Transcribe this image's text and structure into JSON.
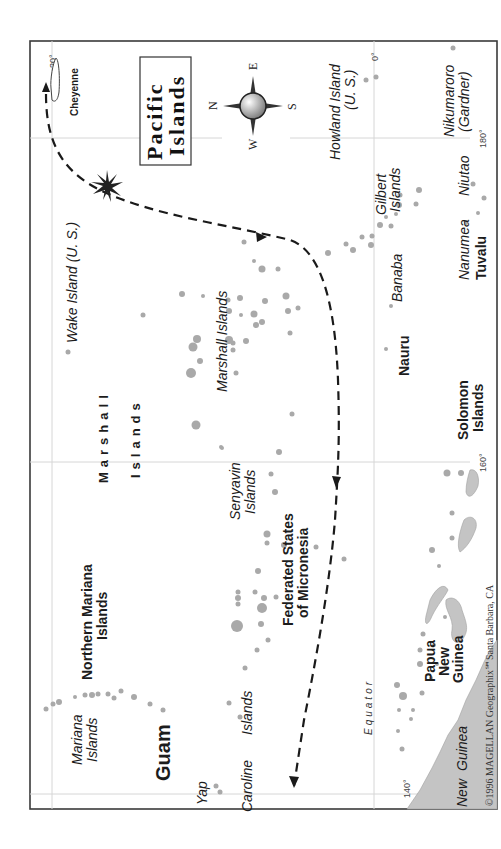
{
  "map": {
    "title_line1": "Pacific",
    "title_line2": "Islands",
    "orientation_note": "North points left",
    "compass": {
      "n": "N",
      "s": "S",
      "e": "E",
      "w": "W"
    },
    "grid_labels": {
      "lat_20": "20°",
      "lat_0": "0°",
      "lon_140": "140°",
      "lon_160": "160°",
      "lon_180": "180°"
    },
    "equator_label": "Equator",
    "ship_label": "Cheyenne",
    "copyright": "©1996 MAGELLAN Geographix℠Santa Barbara, CA",
    "regions": {
      "marshall_islands_country_line1": "Marshall",
      "marshall_islands_country_line2": "Islands",
      "northern_mariana_line1": "Northern Mariana",
      "northern_mariana_line2": "Islands",
      "fsm_line1": "Federated States",
      "fsm_line2": "of Micronesia",
      "guam": "Guam",
      "nauru": "Nauru",
      "solomon_line1": "Solomon",
      "solomon_line2": "Islands",
      "tuvalu": "Tuvalu",
      "png_line1": "Papua",
      "png_line2": "New",
      "png_line3": "Guinea"
    },
    "islands": {
      "wake": "Wake Island (U. S.)",
      "marshall_group": "Marshall Islands",
      "senyavin_line1": "Senyavin",
      "senyavin_line2": "Islands",
      "mariana_line1": "Mariana",
      "mariana_line2": "Islands",
      "yap": "Yap",
      "caroline": "Caroline",
      "caroline_islands": "Islands",
      "howland_line1": "Howland Island",
      "howland_line2": "(U. S.)",
      "gilbert_line1": "Gilbert",
      "gilbert_line2": "Islands",
      "banaba": "Banaba",
      "nikumaroro_line1": "Nikumaroro",
      "nikumaroro_line2": "(Gardner)",
      "nanumea": "Nanumea",
      "niutao": "Niutao",
      "new_guinea_line1": "New",
      "new_guinea_line2": "Guinea"
    },
    "colors": {
      "island_fill": "#a9a9a9",
      "land_fill": "#c4c4c4",
      "route": "#1a1a1a",
      "frame": "#3a3a3a"
    }
  }
}
